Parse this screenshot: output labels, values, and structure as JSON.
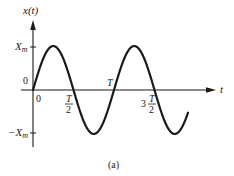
{
  "figure": {
    "caption": "(a)",
    "y_axis_label": "x(t)",
    "x_axis_label": "t",
    "y_ticks": {
      "max": {
        "main": "X",
        "sub": "m"
      },
      "zero": "0",
      "min": {
        "main": "−X",
        "sub": "m"
      }
    },
    "x_ticks": {
      "origin": "0",
      "half_period": {
        "num": "T",
        "den": "2"
      },
      "period": "T",
      "three_half": {
        "coef": "3",
        "num": "T",
        "den": "2"
      }
    },
    "curve": {
      "type": "sine",
      "description": "x(t) = X_m sin(2πt/T), plotted from t = 0 to about 1.9T"
    },
    "colors": {
      "ink": "#1a1a1a",
      "background": "#ffffff"
    }
  }
}
